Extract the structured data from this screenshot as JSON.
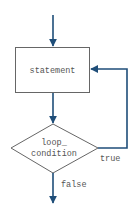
{
  "diagram": {
    "type": "flowchart-do-while",
    "colors": {
      "arrow": "#1f4e79",
      "shape_stroke": "#666666",
      "text": "#555555",
      "background": "#ffffff"
    },
    "nodes": {
      "statement": {
        "label": "statement"
      },
      "condition": {
        "label_line1": "loop_",
        "label_line2": "condition"
      }
    },
    "edges": {
      "true_label": "true",
      "false_label": "false"
    }
  }
}
